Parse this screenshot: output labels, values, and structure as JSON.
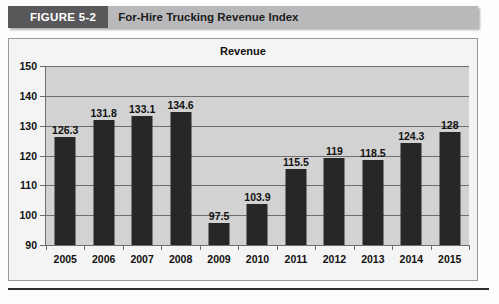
{
  "figure": {
    "number_label": "FIGURE 5-2",
    "title": "For-Hire Trucking Revenue Index"
  },
  "chart_data": {
    "type": "bar",
    "title": "Revenue",
    "xlabel": "",
    "ylabel": "",
    "ylim": [
      90,
      150
    ],
    "ytick_step": 10,
    "yticks": [
      150,
      140,
      130,
      120,
      110,
      100,
      90
    ],
    "grid": true,
    "legend": false,
    "bar_color": "#272727",
    "plot_background": "#d2d2d2",
    "categories": [
      "2005",
      "2006",
      "2007",
      "2008",
      "2009",
      "2010",
      "2011",
      "2012",
      "2013",
      "2014",
      "2015"
    ],
    "values": [
      126.3,
      131.8,
      133.1,
      134.6,
      97.5,
      103.9,
      115.5,
      119,
      118.5,
      124.3,
      128
    ],
    "value_labels": [
      "126.3",
      "131.8",
      "133.1",
      "134.6",
      "97.5",
      "103.9",
      "115.5",
      "119",
      "118.5",
      "124.3",
      "128"
    ]
  }
}
